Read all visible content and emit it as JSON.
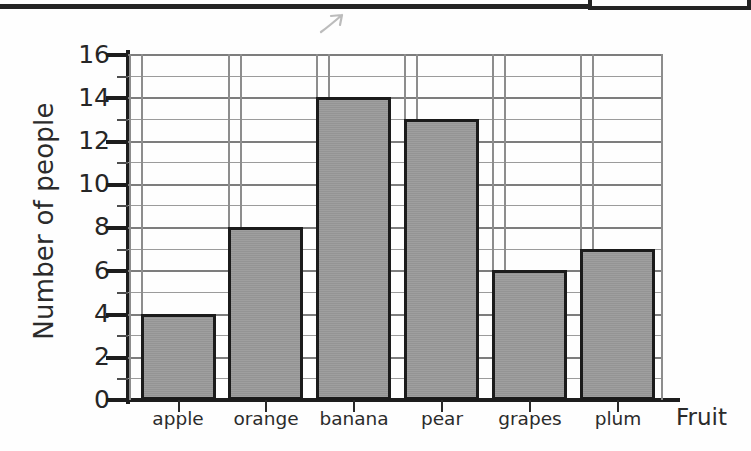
{
  "chart_data": {
    "type": "bar",
    "title": "",
    "subtitle": "",
    "xlabel": "Fruit",
    "ylabel": "Number of people",
    "categories": [
      "apple",
      "orange",
      "banana",
      "pear",
      "grapes",
      "plum"
    ],
    "values": [
      4,
      8,
      14,
      13,
      6,
      7
    ],
    "series": [
      {
        "name": "Number of people",
        "values": [
          4,
          8,
          14,
          13,
          6,
          7
        ]
      }
    ],
    "ylim": [
      0,
      16
    ],
    "ytick_labels": [
      "0",
      "2",
      "4",
      "6",
      "8",
      "10",
      "12",
      "14",
      "16"
    ],
    "ytick_values": [
      0,
      2,
      4,
      6,
      8,
      10,
      12,
      14,
      16
    ],
    "y_minor_step": 1,
    "grid": "horizontal-major-and-minor plus light vertical lines between bars",
    "legend": "none",
    "legend_position": "none",
    "bar_fill_color": "#9a9a9a",
    "bar_border_color": "#1b1b1b",
    "annotations": [
      "faint handwritten pencil mark near top of page"
    ]
  },
  "axes": {
    "y_title": "Number of people",
    "x_title": "Fruit",
    "y_labels": [
      "16",
      "14",
      "12",
      "10",
      "8",
      "6",
      "4",
      "2",
      "0"
    ],
    "x_labels": [
      "apple",
      "orange",
      "banana",
      "pear",
      "grapes",
      "plum"
    ]
  },
  "icons": {
    "pencil_mark": "handwritten-pencil-mark"
  }
}
